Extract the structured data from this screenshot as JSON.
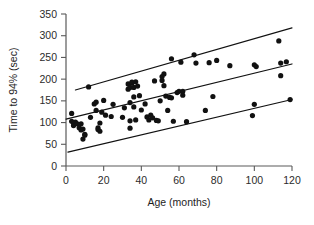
{
  "chart_data": {
    "type": "scatter",
    "title": "",
    "xlabel": "Age (months)",
    "ylabel": "Time to 94% (sec)",
    "xlim": [
      0,
      120
    ],
    "ylim": [
      0,
      350
    ],
    "xticks": [
      0,
      20,
      40,
      60,
      80,
      100,
      120
    ],
    "yticks": [
      0,
      50,
      100,
      150,
      200,
      250,
      300,
      350
    ],
    "grid": false,
    "legend": false,
    "marker": "filled-circle",
    "marker_color": "#111111",
    "points": [
      [
        3,
        121
      ],
      [
        3,
        103
      ],
      [
        4,
        99
      ],
      [
        4,
        93
      ],
      [
        5,
        101
      ],
      [
        6,
        97
      ],
      [
        7,
        88
      ],
      [
        8,
        83
      ],
      [
        8,
        97
      ],
      [
        9,
        85
      ],
      [
        9,
        62
      ],
      [
        10,
        73
      ],
      [
        10,
        71
      ],
      [
        12,
        182
      ],
      [
        13,
        112
      ],
      [
        15,
        143
      ],
      [
        16,
        147
      ],
      [
        16,
        128
      ],
      [
        17,
        88
      ],
      [
        17,
        84
      ],
      [
        18,
        80
      ],
      [
        18,
        99
      ],
      [
        19,
        124
      ],
      [
        20,
        151
      ],
      [
        21,
        117
      ],
      [
        24,
        114
      ],
      [
        25,
        142
      ],
      [
        30,
        112
      ],
      [
        31,
        134
      ],
      [
        33,
        189
      ],
      [
        33,
        177
      ],
      [
        34,
        181
      ],
      [
        34,
        146
      ],
      [
        34,
        104
      ],
      [
        34,
        87
      ],
      [
        35,
        191
      ],
      [
        35,
        193
      ],
      [
        36,
        159
      ],
      [
        36,
        181
      ],
      [
        36,
        136
      ],
      [
        37,
        194
      ],
      [
        37,
        106
      ],
      [
        38,
        184
      ],
      [
        39,
        162
      ],
      [
        40,
        129
      ],
      [
        42,
        143
      ],
      [
        43,
        113
      ],
      [
        44,
        106
      ],
      [
        45,
        117
      ],
      [
        46,
        111
      ],
      [
        47,
        196
      ],
      [
        48,
        105
      ],
      [
        49,
        104
      ],
      [
        50,
        150
      ],
      [
        51,
        206
      ],
      [
        51,
        197
      ],
      [
        52,
        212
      ],
      [
        52,
        185
      ],
      [
        53,
        161
      ],
      [
        54,
        128
      ],
      [
        55,
        158
      ],
      [
        56,
        247
      ],
      [
        56,
        157
      ],
      [
        57,
        103
      ],
      [
        59,
        169
      ],
      [
        60,
        172
      ],
      [
        61,
        239
      ],
      [
        62,
        163
      ],
      [
        62,
        172
      ],
      [
        64,
        102
      ],
      [
        68,
        256
      ],
      [
        69,
        237
      ],
      [
        74,
        128
      ],
      [
        76,
        238
      ],
      [
        78,
        160
      ],
      [
        80,
        243
      ],
      [
        87,
        231
      ],
      [
        99,
        116
      ],
      [
        100,
        142
      ],
      [
        100,
        233
      ],
      [
        101,
        229
      ],
      [
        113,
        288
      ],
      [
        114,
        208
      ],
      [
        114,
        237
      ],
      [
        117,
        240
      ],
      [
        119,
        153
      ]
    ],
    "lines": [
      {
        "name": "upper-prediction-band",
        "x": [
          5,
          120
        ],
        "y": [
          175,
          318
        ]
      },
      {
        "name": "regression-line",
        "x": [
          0,
          120
        ],
        "y": [
          108,
          235
        ]
      },
      {
        "name": "lower-prediction-band",
        "x": [
          1,
          120
        ],
        "y": [
          32,
          153
        ]
      }
    ]
  }
}
